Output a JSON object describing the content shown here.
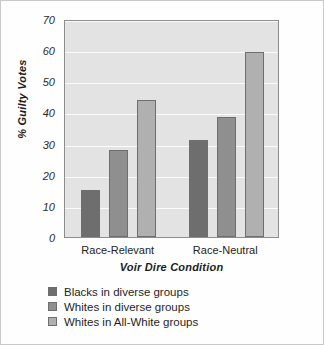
{
  "chart_data": {
    "type": "bar",
    "title": "",
    "xlabel": "Voir Dire Condition",
    "ylabel": "% Guilty Votes",
    "categories": [
      "Race-Relevant",
      "Race-Neutral"
    ],
    "series": [
      {
        "name": "Blacks in diverse groups",
        "color": "#6e6e6e",
        "values": [
          15,
          31
        ]
      },
      {
        "name": "Whites in diverse groups",
        "color": "#8f8f8f",
        "values": [
          28,
          38.5
        ]
      },
      {
        "name": "Whites in All-White groups",
        "color": "#b0b0b0",
        "values": [
          44,
          59.5
        ]
      }
    ],
    "ylim": [
      0,
      70
    ],
    "yticks": [
      70,
      60,
      50,
      40,
      30,
      20,
      10,
      0
    ],
    "grid": true,
    "legend_position": "below",
    "plot_background": "#e3e3e3",
    "gridline_color": "#fbfbfb",
    "axis_color": "#8d8d8d"
  }
}
